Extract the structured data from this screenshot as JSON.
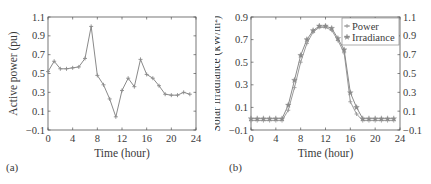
{
  "panels": {
    "a": {
      "label": "(a)"
    },
    "b": {
      "label": "(b)"
    }
  },
  "chart_data": [
    {
      "id": "a",
      "type": "line",
      "title": "",
      "xlabel": "Time (hour)",
      "ylabel": "Active power (pu)",
      "xlim": [
        0,
        24
      ],
      "ylim": [
        -0.1,
        1.1
      ],
      "xticks": [
        0,
        4,
        8,
        12,
        16,
        20,
        24
      ],
      "yticks": [
        -0.1,
        0.1,
        0.3,
        0.5,
        0.7,
        0.9,
        1.1
      ],
      "ytick_labels": [
        "−0.1",
        "0.1",
        "0.3",
        "0.5",
        "0.7",
        "0.9",
        "1.1"
      ],
      "grid": false,
      "legend": null,
      "x": [
        0,
        1,
        2,
        3,
        4,
        5,
        6,
        7,
        8,
        9,
        10,
        11,
        12,
        13,
        14,
        15,
        16,
        17,
        18,
        19,
        20,
        21,
        22,
        23
      ],
      "series": [
        {
          "name": "Active power",
          "marker": "plus",
          "color": "#8a8a8a",
          "values": [
            0.52,
            0.63,
            0.55,
            0.55,
            0.56,
            0.57,
            0.66,
            1.0,
            0.48,
            0.38,
            0.23,
            0.04,
            0.32,
            0.45,
            0.36,
            0.65,
            0.49,
            0.45,
            0.37,
            0.28,
            0.27,
            0.27,
            0.3,
            0.28
          ]
        }
      ]
    },
    {
      "id": "b",
      "type": "line",
      "title": "",
      "xlabel": "Time (hour)",
      "ylabel": "Solar irradiance (kW/m²)",
      "ylabel_right": "",
      "xlim": [
        0,
        24
      ],
      "ylim": [
        -0.1,
        0.9
      ],
      "ylim_right": [
        -0.1,
        1.1
      ],
      "xticks": [
        0,
        4,
        8,
        12,
        16,
        20,
        24
      ],
      "yticks": [
        -0.1,
        0.1,
        0.3,
        0.5,
        0.7,
        0.9
      ],
      "ytick_labels": [
        "−0.1",
        "0.1",
        "0.3",
        "0.5",
        "0.7",
        "0.9"
      ],
      "yticks_right": [
        -0.1,
        0.1,
        0.3,
        0.5,
        0.7,
        0.9,
        1.1
      ],
      "ytick_labels_right": [
        "−0.1",
        "0.1",
        "0.3",
        "0.5",
        "0.7",
        "0.9",
        "1.1"
      ],
      "grid": false,
      "legend": {
        "position": "upper right",
        "entries": [
          "Power",
          "Irradiance"
        ]
      },
      "x": [
        0,
        1,
        2,
        3,
        4,
        5,
        6,
        7,
        8,
        9,
        10,
        11,
        12,
        13,
        14,
        15,
        16,
        17,
        18,
        19,
        20,
        21,
        22,
        23
      ],
      "series": [
        {
          "name": "Power",
          "axis": "right",
          "marker": "plus",
          "color": "#9a9a9a",
          "values": [
            0,
            0,
            0,
            0,
            0,
            0,
            0.11,
            0.35,
            0.62,
            0.82,
            0.94,
            0.99,
            0.99,
            0.96,
            0.85,
            0.72,
            0.2,
            0.07,
            0,
            0,
            0,
            0,
            0,
            0
          ]
        },
        {
          "name": "Irradiance",
          "axis": "left",
          "marker": "star",
          "color": "#8a8a8a",
          "values": [
            0,
            0,
            0,
            0,
            0,
            0,
            0.12,
            0.34,
            0.56,
            0.7,
            0.78,
            0.82,
            0.82,
            0.8,
            0.71,
            0.61,
            0.23,
            0.1,
            0,
            0,
            0,
            0,
            0,
            0
          ]
        }
      ]
    }
  ]
}
